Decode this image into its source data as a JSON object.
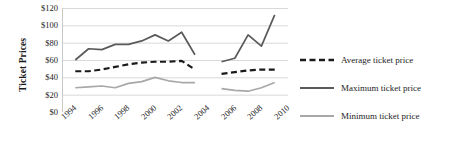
{
  "chart_data": {
    "type": "line",
    "title": "",
    "xlabel": "",
    "ylabel": "Ticket Prices",
    "ylim": [
      0,
      120
    ],
    "ytick_values": [
      0,
      20,
      40,
      60,
      80,
      100,
      120
    ],
    "ytick_labels": [
      "$0",
      "$20",
      "$40",
      "$60",
      "$80",
      "$100",
      "$120"
    ],
    "xlim": [
      1994,
      2011
    ],
    "xtick_labels": [
      "1994",
      "1996",
      "1998",
      "2000",
      "2002",
      "2004",
      "2006",
      "2008",
      "2010"
    ],
    "xtick_values": [
      1994,
      1996,
      1998,
      2000,
      2002,
      2004,
      2006,
      2008,
      2010
    ],
    "grid": "horizontal",
    "legend_position": "right",
    "series": [
      {
        "name": "Average ticket price",
        "style": "dashed",
        "color": "#1a1a1a",
        "x": [
          1995,
          1996,
          1997,
          1998,
          1999,
          2000,
          2001,
          2002,
          2003,
          2004,
          2006,
          2007,
          2008,
          2009,
          2010
        ],
        "values": [
          47,
          47,
          49,
          52,
          55,
          57,
          58,
          58,
          59,
          49,
          44,
          46,
          48,
          49,
          49
        ],
        "gap_between": [
          2004,
          2006
        ]
      },
      {
        "name": "Maximum ticket price",
        "style": "solid",
        "color": "#5a5a5a",
        "x": [
          1995,
          1996,
          1997,
          1998,
          1999,
          2000,
          2001,
          2002,
          2003,
          2004,
          2006,
          2007,
          2008,
          2009,
          2010
        ],
        "values": [
          60,
          73,
          72,
          78,
          78,
          82,
          89,
          82,
          92,
          66,
          58,
          62,
          89,
          76,
          112
        ],
        "gap_between": [
          2004,
          2006
        ]
      },
      {
        "name": "Minimum ticket price",
        "style": "solid",
        "color": "#a8a8a8",
        "x": [
          1995,
          1996,
          1997,
          1998,
          1999,
          2000,
          2001,
          2002,
          2003,
          2004,
          2006,
          2007,
          2008,
          2009,
          2010
        ],
        "values": [
          28,
          29,
          30,
          28,
          33,
          35,
          40,
          36,
          34,
          34,
          27,
          25,
          24,
          28,
          34
        ],
        "gap_between": [
          2004,
          2006
        ]
      }
    ]
  },
  "legend": {
    "items": [
      {
        "label": "Average ticket price",
        "style": "dashed",
        "color": "#1a1a1a"
      },
      {
        "label": "Maximum ticket price",
        "style": "solid",
        "color": "#5a5a5a"
      },
      {
        "label": "Minimum ticket price",
        "style": "solid",
        "color": "#a8a8a8"
      }
    ]
  }
}
